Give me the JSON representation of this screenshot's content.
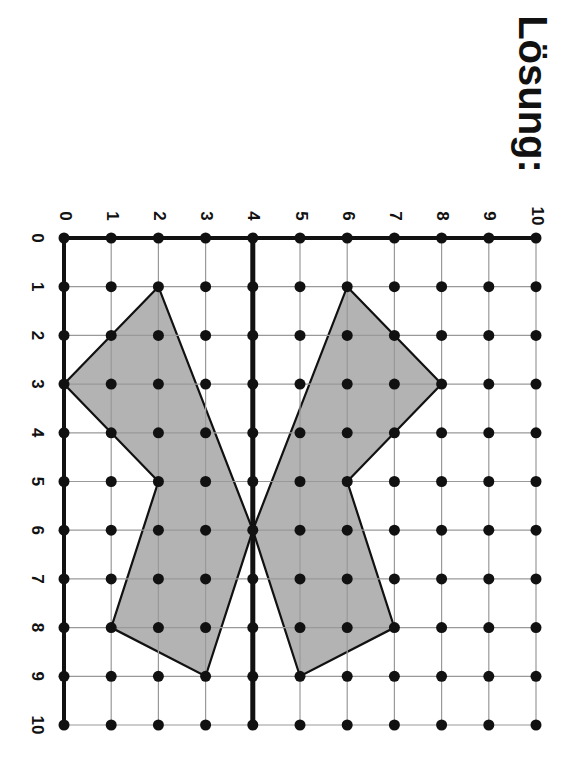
{
  "title": "Lösung:",
  "grid": {
    "origin_px": [
      64,
      238
    ],
    "step_px": [
      47.2,
      48.7
    ],
    "top_labels": [
      "0",
      "1",
      "2",
      "3",
      "4",
      "5",
      "6",
      "7",
      "8",
      "9",
      "10"
    ],
    "left_labels": [
      "0",
      "1",
      "2",
      "3",
      "4",
      "5",
      "6",
      "7",
      "8",
      "9",
      "10"
    ],
    "symmetry_axis_col": 4
  },
  "shapes": {
    "left_wing": [
      [
        2,
        1
      ],
      [
        0,
        3
      ],
      [
        1,
        4
      ],
      [
        2,
        5
      ],
      [
        1,
        8
      ],
      [
        3,
        9
      ],
      [
        4,
        6
      ]
    ],
    "right_wing": [
      [
        6,
        1
      ],
      [
        8,
        3
      ],
      [
        7,
        4
      ],
      [
        6,
        5
      ],
      [
        7,
        8
      ],
      [
        5,
        9
      ],
      [
        4,
        6
      ]
    ]
  },
  "colors": {
    "fill": "#b3b3b3",
    "line": "#111111",
    "grid": "#999999",
    "dot": "#111111"
  }
}
